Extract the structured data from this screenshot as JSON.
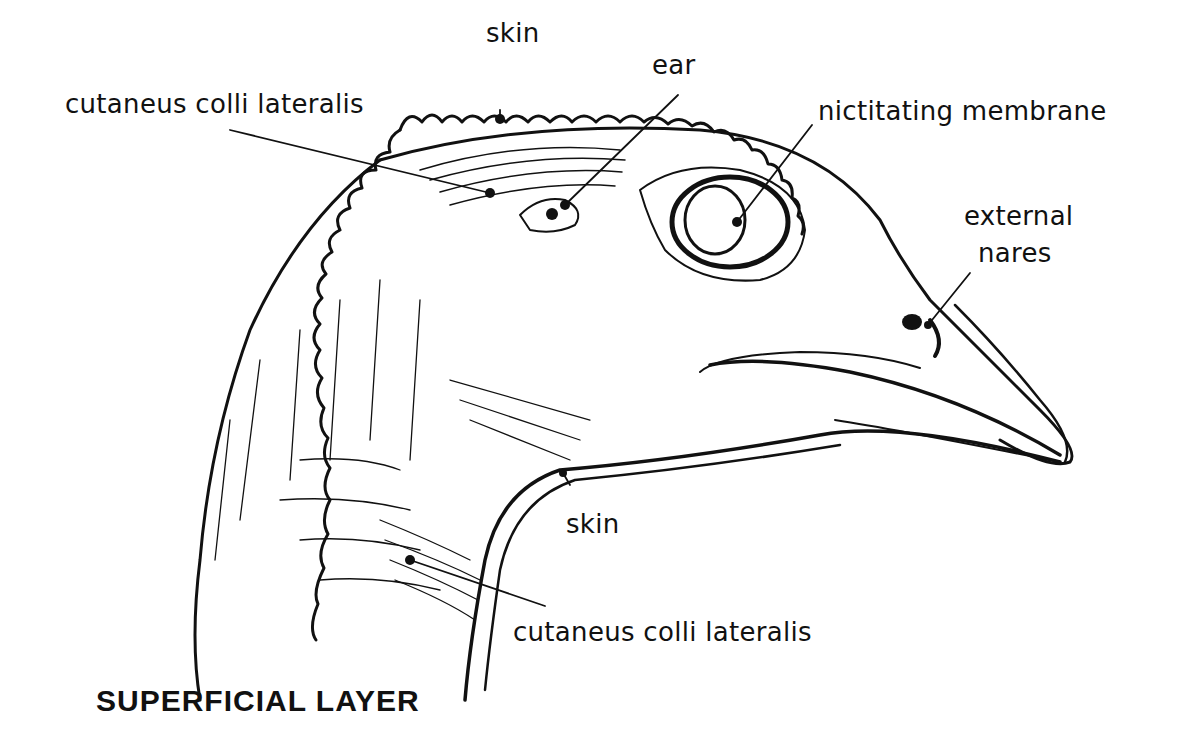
{
  "figure": {
    "title": "SUPERFICIAL LAYER",
    "colors": {
      "ink": "#111111",
      "background": "#ffffff"
    }
  },
  "labels": [
    {
      "id": "skin_top",
      "text": "skin"
    },
    {
      "id": "cutaneus_top",
      "text": "cutaneus colli lateralis"
    },
    {
      "id": "ear",
      "text": "ear"
    },
    {
      "id": "nictitating",
      "text": "nictitating membrane"
    },
    {
      "id": "external_nares_1",
      "text": "external"
    },
    {
      "id": "external_nares_2",
      "text": "nares"
    },
    {
      "id": "skin_bottom",
      "text": "skin"
    },
    {
      "id": "cutaneus_bottom",
      "text": "cutaneus colli lateralis"
    }
  ]
}
